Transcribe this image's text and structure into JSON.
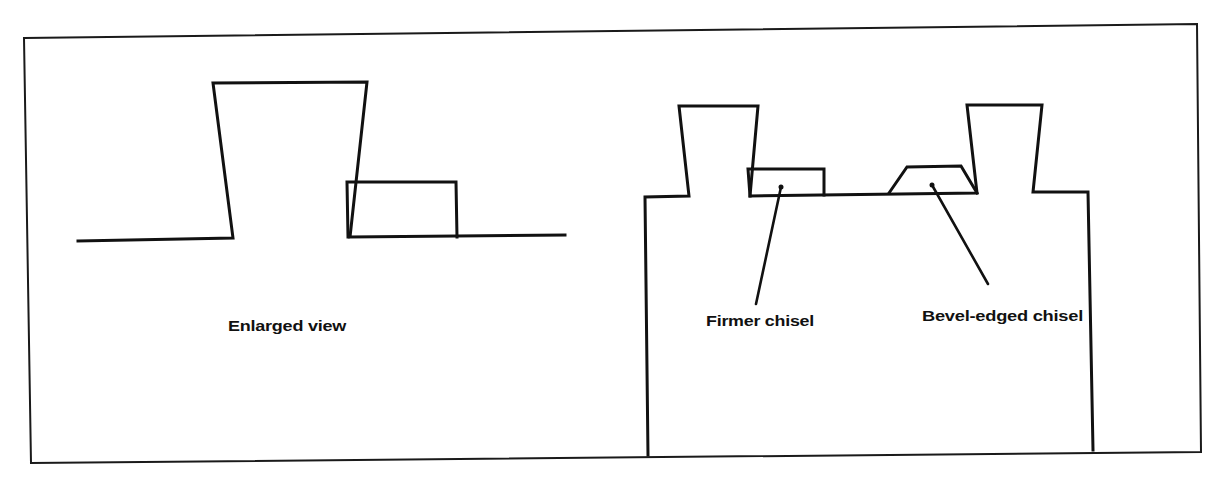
{
  "colors": {
    "ink": "#111111",
    "background": "#ffffff"
  },
  "panels": {
    "left": {
      "caption": "Enlarged view"
    },
    "right": {
      "labels": {
        "firmer_chisel": "Firmer chisel",
        "bevel_edged_chisel": "Bevel-edged chisel"
      }
    }
  }
}
